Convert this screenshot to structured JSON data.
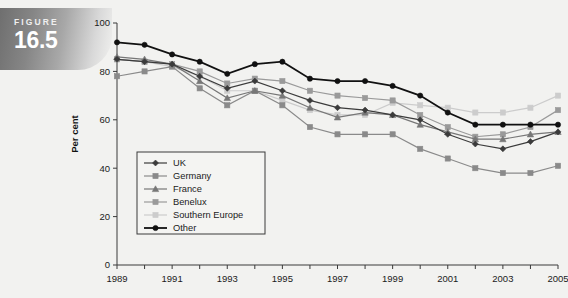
{
  "figure": {
    "label": "FIGURE",
    "number": "16.5"
  },
  "chart_data": {
    "type": "line",
    "title": "",
    "xlabel": "",
    "ylabel": "Per cent",
    "xlim": [
      1989,
      2005
    ],
    "ylim": [
      0,
      100
    ],
    "yticks": [
      0,
      20,
      40,
      60,
      80,
      100
    ],
    "ytick_labels": [
      "0",
      "20",
      "40",
      "60",
      "80",
      "100"
    ],
    "x": [
      1989,
      1990,
      1991,
      1992,
      1993,
      1994,
      1995,
      1996,
      1997,
      1998,
      1999,
      2000,
      2001,
      2002,
      2003,
      2004,
      2005
    ],
    "xtick_labels": [
      "1989",
      "1991",
      "1993",
      "1995",
      "1997",
      "1999",
      "2001",
      "2003",
      "2005"
    ],
    "xticks_labelled": [
      1989,
      1991,
      1993,
      1995,
      1997,
      1999,
      2001,
      2003,
      2005
    ],
    "grid": false,
    "legend_position": "inside-lower-left",
    "series": [
      {
        "name": "UK",
        "marker": "diamond",
        "color": "#3b3b3b",
        "values": [
          85,
          84,
          83,
          78,
          73,
          76,
          72,
          68,
          65,
          64,
          62,
          60,
          54,
          50,
          48,
          51,
          55
        ]
      },
      {
        "name": "Germany",
        "marker": "square",
        "color": "#8a8a8a",
        "values": [
          78,
          80,
          82,
          73,
          66,
          72,
          66,
          57,
          54,
          54,
          54,
          48,
          44,
          40,
          38,
          38,
          41
        ]
      },
      {
        "name": "France",
        "marker": "triangle",
        "color": "#777777",
        "values": [
          86,
          85,
          83,
          76,
          69,
          72,
          70,
          65,
          61,
          63,
          62,
          58,
          55,
          52,
          52,
          54,
          55
        ]
      },
      {
        "name": "Benelux",
        "marker": "square",
        "color": "#9a9a9a",
        "values": [
          85,
          84,
          83,
          80,
          75,
          77,
          76,
          72,
          70,
          69,
          68,
          62,
          57,
          53,
          54,
          57,
          64
        ]
      },
      {
        "name": "Southern Europe",
        "marker": "square",
        "color": "#cccccc",
        "values": [
          85,
          84,
          82,
          78,
          72,
          72,
          68,
          64,
          62,
          62,
          67,
          66,
          65,
          63,
          63,
          65,
          70
        ]
      },
      {
        "name": "Other",
        "marker": "circle",
        "color": "#111111",
        "values": [
          92,
          91,
          87,
          84,
          79,
          83,
          84,
          77,
          76,
          76,
          74,
          70,
          63,
          58,
          58,
          58,
          58
        ]
      }
    ]
  }
}
